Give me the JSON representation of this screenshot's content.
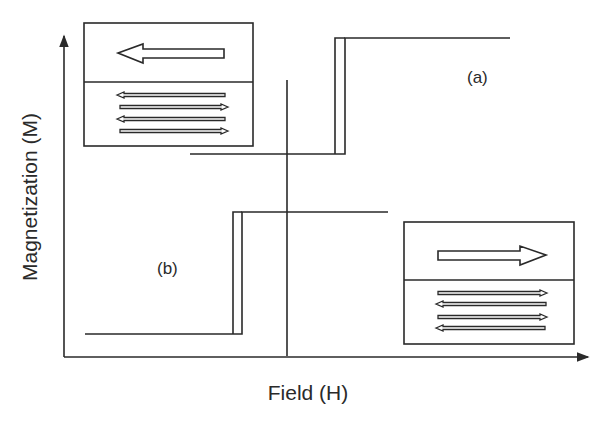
{
  "figure": {
    "type": "magnetic hysteresis schematic (exchange-biased loops)",
    "axes": {
      "x_label": "Field (H)",
      "y_label": "Magnetization (M)"
    },
    "curves": [
      {
        "id": "a",
        "label": "(a)",
        "description": "Square hysteresis loop shifted to positive field",
        "low_level_y": 154,
        "high_level_y": 38,
        "switch_x": [
          335,
          345
        ]
      },
      {
        "id": "b",
        "label": "(b)",
        "description": "Square hysteresis loop shifted to negative field",
        "low_level_y": 334,
        "high_level_y": 212,
        "switch_x": [
          233,
          242
        ]
      }
    ],
    "insets": [
      {
        "id": "inset-negative",
        "position": "top-left",
        "ferromagnet_arrow": "left",
        "antiferromagnet_arrows": [
          "left",
          "right",
          "left",
          "right"
        ]
      },
      {
        "id": "inset-positive",
        "position": "bottom-right",
        "ferromagnet_arrow": "right",
        "antiferromagnet_arrows": [
          "right",
          "left",
          "right",
          "left"
        ]
      }
    ],
    "colors": {
      "line": "#2a2a2a",
      "background": "#ffffff"
    }
  }
}
